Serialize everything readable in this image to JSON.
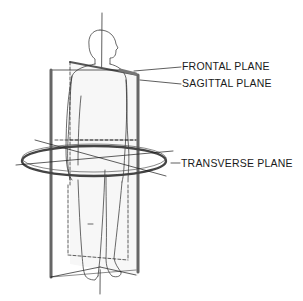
{
  "diagram": {
    "labels": {
      "frontal": "FRONTAL PLANE",
      "sagittal": "SAGITTAL PLANE",
      "transverse": "TRANSVERSE PLANE"
    },
    "colors": {
      "line": "#1a1a1a",
      "plane_edge": "#6e6e6e",
      "background": "#ffffff"
    }
  }
}
